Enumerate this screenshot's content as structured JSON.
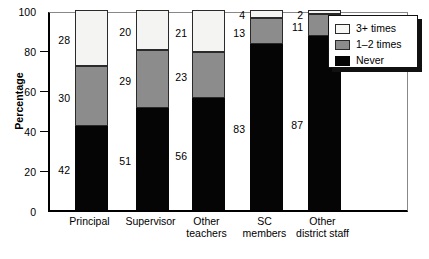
{
  "chart_data": {
    "type": "bar",
    "subtype": "stacked-bar-100",
    "title": "",
    "xlabel": "",
    "ylabel": "Percentage",
    "ylim": [
      0,
      100
    ],
    "yticks": [
      0,
      20,
      40,
      60,
      80,
      100
    ],
    "ytick_labels": [
      "0",
      "20",
      "40",
      "60",
      "80",
      "100"
    ],
    "grid": false,
    "legend_position": "top-right",
    "categories": [
      "Principal",
      "Supervisor",
      "Other teachers",
      "SC members",
      "Other district staff"
    ],
    "category_lines": [
      [
        "Principal"
      ],
      [
        "Supervisor"
      ],
      [
        "Other",
        "teachers"
      ],
      [
        "SC",
        "members"
      ],
      [
        "Other",
        "district staff"
      ]
    ],
    "series": [
      {
        "name": "Never",
        "color": "#050505",
        "values": [
          42,
          51,
          56,
          83,
          87
        ]
      },
      {
        "name": "1–2 times",
        "color": "#8c8c8c",
        "values": [
          30,
          29,
          23,
          13,
          11
        ]
      },
      {
        "name": "3+ times",
        "color": "#f4f4f2",
        "values": [
          28,
          20,
          21,
          4,
          2
        ]
      }
    ],
    "legend_entries": [
      {
        "label": "3+ times",
        "color": "#f7f7f6"
      },
      {
        "label": "1–2 times",
        "color": "#8c8c8c"
      },
      {
        "label": "Never",
        "color": "#050505"
      }
    ]
  }
}
